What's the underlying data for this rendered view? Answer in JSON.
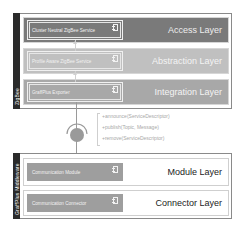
{
  "diagram": {
    "top_group": {
      "label": "ZigBee",
      "layers": [
        {
          "title": "Access Layer",
          "component": "Cluster Neutral ZigBee Service",
          "bg": "#7a7a7a",
          "title_color": "#eeeeee"
        },
        {
          "title": "Abstraction Layer",
          "component": "Profile Aware ZigBee Service",
          "bg": "#c0c0c0",
          "title_color": "#f4f4f4"
        },
        {
          "title": "Integration Layer",
          "component": "GraffPlus Exporter",
          "bg": "#a8a8a8",
          "title_color": "#f4f4f4"
        }
      ]
    },
    "interface": {
      "methods": [
        "+announce(ServiceDescriptor)",
        "+publish(Topic, Message)",
        "+remove(ServiceDescriptor)"
      ],
      "color": "#9a9a9a"
    },
    "bottom_group": {
      "label": "GraffPlus Middleware",
      "layers": [
        {
          "title": "Module Layer",
          "component": "Communication Module",
          "bg": "#ffffff",
          "title_color": "#222222"
        },
        {
          "title": "Connector Layer",
          "component": "Communication Connector",
          "bg": "#ffffff",
          "title_color": "#222222"
        }
      ],
      "component_bg": "#9e9e9e"
    }
  }
}
